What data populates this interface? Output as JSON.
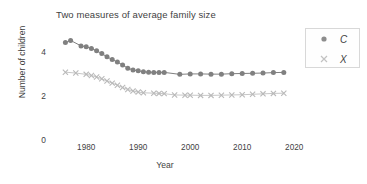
{
  "chart_data": {
    "type": "line",
    "title": "Two measures of average family size",
    "xlabel": "Year",
    "ylabel": "Number of children",
    "xlim": [
      1974,
      2024
    ],
    "ylim": [
      0,
      5.0
    ],
    "xticks": [
      1980,
      1990,
      2000,
      2010,
      2020
    ],
    "yticks": [
      0,
      2,
      4
    ],
    "grid": false,
    "legend_position": "upper right",
    "colors": {
      "C": "#808080",
      "X": "#b9b9b9",
      "text": "#3f3f3f",
      "legend_border": "#d8d8d8"
    },
    "series": [
      {
        "name": "C",
        "label": "C",
        "marker": "circle",
        "color": "#808080",
        "x": [
          1976,
          1977,
          1979,
          1980,
          1981,
          1982,
          1983,
          1984,
          1985,
          1986,
          1987,
          1988,
          1989,
          1990,
          1991,
          1992,
          1993,
          1994,
          1995,
          1998,
          2000,
          2002,
          2004,
          2006,
          2008,
          2010,
          2012,
          2014,
          2016,
          2018
        ],
        "y": [
          4.47,
          4.57,
          4.32,
          4.28,
          4.2,
          4.1,
          3.97,
          3.82,
          3.7,
          3.58,
          3.45,
          3.3,
          3.22,
          3.18,
          3.14,
          3.12,
          3.11,
          3.11,
          3.11,
          3.02,
          3.04,
          3.04,
          3.03,
          3.03,
          3.05,
          3.06,
          3.07,
          3.08,
          3.1,
          3.11
        ]
      },
      {
        "name": "X",
        "label": "X",
        "marker": "x",
        "color": "#b9b9b9",
        "x": [
          1976,
          1978,
          1980,
          1981,
          1982,
          1983,
          1984,
          1985,
          1986,
          1987,
          1988,
          1989,
          1990,
          1991,
          1993,
          1994,
          1995,
          1997,
          1999,
          2000,
          2002,
          2004,
          2006,
          2008,
          2010,
          2012,
          2014,
          2016,
          2018
        ],
        "y": [
          3.12,
          3.08,
          3.02,
          2.97,
          2.9,
          2.82,
          2.72,
          2.62,
          2.52,
          2.42,
          2.33,
          2.26,
          2.21,
          2.18,
          2.16,
          2.15,
          2.14,
          2.08,
          2.07,
          2.07,
          2.06,
          2.06,
          2.07,
          2.08,
          2.09,
          2.11,
          2.13,
          2.15,
          2.16
        ]
      }
    ]
  }
}
